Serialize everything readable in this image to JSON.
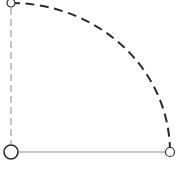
{
  "canvas": {
    "width": 183,
    "height": 169,
    "background": "#ffffff",
    "title": "quarter-ellipse-arc-diagram"
  },
  "colors": {
    "arc_stroke": "#2b2b33",
    "radius_vertical_stroke": "#8a8a92",
    "radius_horizontal_stroke": "#8a8a92",
    "node_stroke": "#2b2b33",
    "node_fill": "#ffffff"
  },
  "nodes": [
    {
      "name": "origin-node",
      "label": "",
      "cx": 11,
      "cy": 152,
      "r": 7,
      "stroke_width": 1.6
    },
    {
      "name": "top-node",
      "label": "",
      "cx": 11,
      "cy": 3,
      "r": 4,
      "stroke_width": 1.2
    },
    {
      "name": "right-node",
      "label": "",
      "cx": 170,
      "cy": 152,
      "r": 4.5,
      "stroke_width": 1.2
    }
  ],
  "edges": [
    {
      "name": "vertical-radius",
      "x1": 11,
      "y1": 8,
      "x2": 11,
      "y2": 144,
      "style": "dashed",
      "dash": "7 4",
      "stroke_width": 1.0
    },
    {
      "name": "horizontal-radius",
      "x1": 19,
      "y1": 152,
      "x2": 165,
      "y2": 152,
      "style": "solid",
      "dash": "",
      "stroke_width": 1.0
    }
  ],
  "arc": {
    "name": "elliptical-arc",
    "start_x": 11,
    "start_y": 3,
    "end_x": 170,
    "end_y": 152,
    "rx": 159,
    "ry": 149,
    "center_x": 11,
    "center_y": 152,
    "sweep_degrees": 90,
    "style": "dashed",
    "dash": "9 5.5",
    "stroke_width": 2.0,
    "path": "M 11 3 A 159 149 0 0 1 170 152"
  }
}
